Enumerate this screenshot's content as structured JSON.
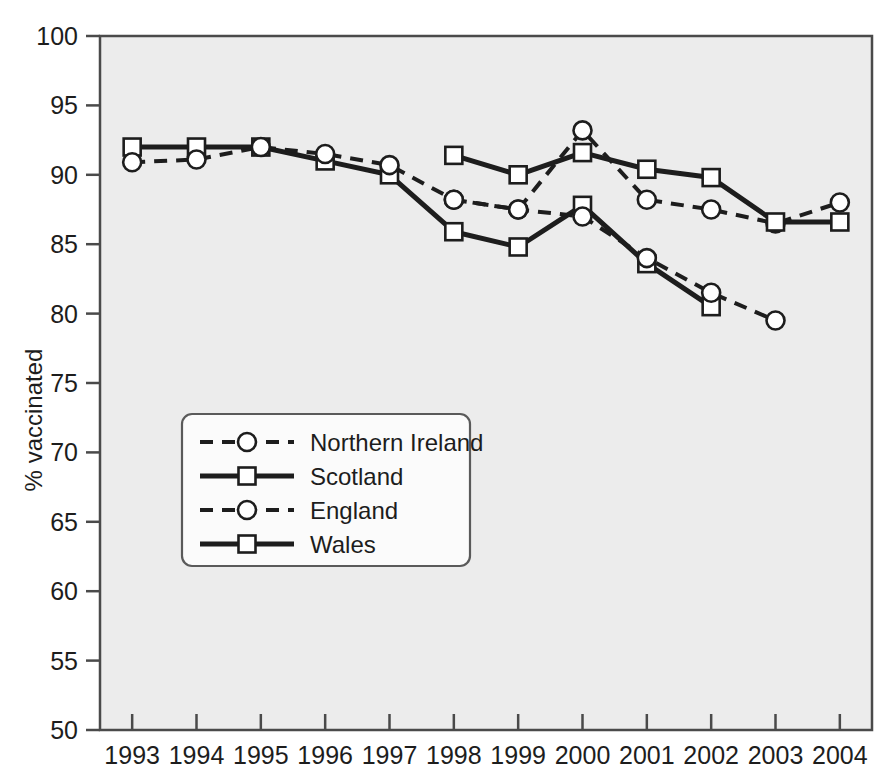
{
  "chart_data": {
    "type": "line",
    "title": "",
    "subtitle": "",
    "xlabel": "",
    "ylabel": "% vaccinated",
    "categories": [
      "1993",
      "1994",
      "1995",
      "1996",
      "1997",
      "1998",
      "1999",
      "2000",
      "2001",
      "2002",
      "2003",
      "2004"
    ],
    "x": [
      1993,
      1994,
      1995,
      1996,
      1997,
      1998,
      1999,
      2000,
      2001,
      2002,
      2003,
      2004
    ],
    "xlim": [
      1992.5,
      2004.5
    ],
    "ylim": [
      50,
      100
    ],
    "yticks": [
      50,
      55,
      60,
      65,
      70,
      75,
      80,
      85,
      90,
      95,
      100
    ],
    "xticks": [
      1993,
      1994,
      1995,
      1996,
      1997,
      1998,
      1999,
      2000,
      2001,
      2002,
      2003,
      2004
    ],
    "grid": false,
    "legend_position": "center-left",
    "series": [
      {
        "name": "Northern Ireland",
        "style": "dashed",
        "marker": "circle",
        "color": "#1d1d1d",
        "x": [
          1998,
          1999,
          2000,
          2001,
          2002,
          2003,
          2004
        ],
        "values": [
          88.2,
          87.5,
          93.2,
          88.2,
          87.5,
          86.5,
          88.0
        ]
      },
      {
        "name": "Scotland",
        "style": "solid",
        "marker": "square",
        "color": "#1d1d1d",
        "x": [
          1993,
          1994,
          1995,
          1996,
          1997,
          1998,
          1999,
          2000,
          2001,
          2002
        ],
        "values": [
          92.0,
          92.0,
          92.0,
          91.0,
          90.0,
          85.9,
          84.8,
          87.8,
          83.6,
          80.5
        ]
      },
      {
        "name": "England",
        "style": "dashed",
        "marker": "circle",
        "color": "#1d1d1d",
        "x": [
          1993,
          1994,
          1995,
          1996,
          1997,
          1998,
          1999,
          2000,
          2001,
          2002,
          2003
        ],
        "values": [
          90.9,
          91.1,
          92.0,
          91.5,
          90.7,
          88.2,
          87.5,
          87.0,
          84.0,
          81.5,
          79.5
        ]
      },
      {
        "name": "Wales",
        "style": "solid",
        "marker": "square",
        "color": "#1d1d1d",
        "x": [
          1998,
          1999,
          2000,
          2001,
          2002,
          2003,
          2004
        ],
        "values": [
          91.4,
          90.0,
          91.6,
          90.4,
          89.8,
          86.6,
          86.6
        ]
      }
    ]
  },
  "legend": {
    "entries": [
      {
        "label": "Northern Ireland",
        "style": "dashed",
        "marker": "circle"
      },
      {
        "label": "Scotland",
        "style": "solid",
        "marker": "square"
      },
      {
        "label": "England",
        "style": "dashed",
        "marker": "circle"
      },
      {
        "label": "Wales",
        "style": "solid",
        "marker": "square"
      }
    ]
  },
  "colors": {
    "plot_background": "#ececec",
    "page_background": "#ffffff",
    "axis": "#4a4a4a",
    "line": "#1d1d1d",
    "marker_fill": "#ffffff",
    "legend_background": "#fbfbfb",
    "legend_border": "#5a5a5a",
    "text": "#1d1d1d"
  }
}
